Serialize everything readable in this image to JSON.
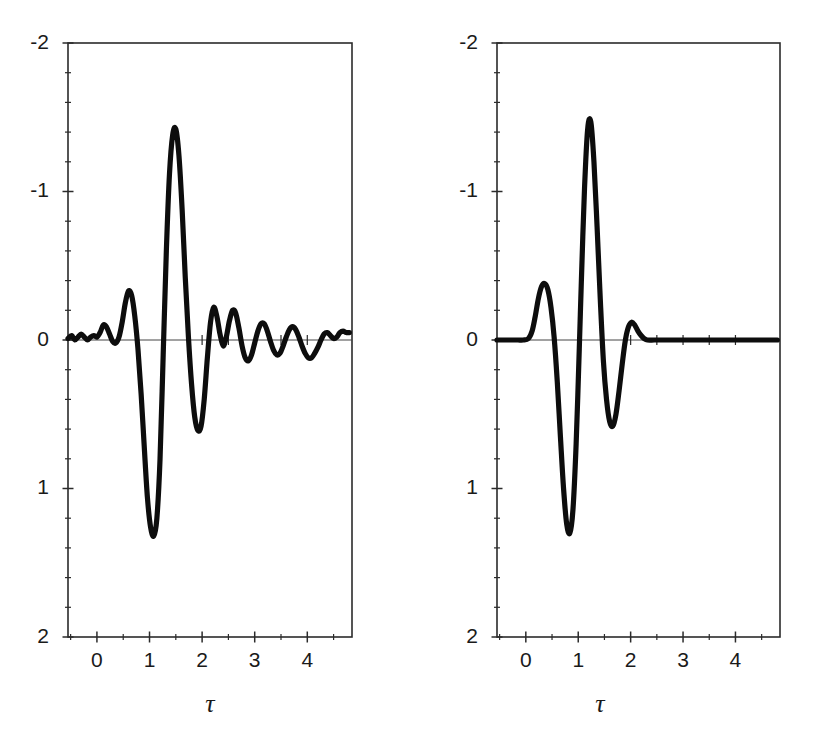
{
  "figure": {
    "background_color": "#ffffff",
    "ink_color": "#0d0d0d",
    "axis_color": "#2b2b2b",
    "panel_count": 2
  },
  "axis_title_symbol": "τ",
  "y_tick_labels": [
    "2",
    "1",
    "0",
    "-1",
    "-2"
  ],
  "x_tick_labels": [
    "0",
    "1",
    "2",
    "3",
    "4"
  ],
  "chart_data": [
    {
      "id": "left-panel",
      "type": "line",
      "title": "",
      "subtitle": "",
      "xlabel": "τ",
      "ylabel": "",
      "xlim": [
        -0.55,
        4.85
      ],
      "ylim": [
        -2,
        2
      ],
      "grid": false,
      "legend": "none",
      "x_major_ticks": [
        0,
        1,
        2,
        3,
        4
      ],
      "x_minor_tick_step": 0.5,
      "y_major_ticks": [
        -2,
        -1,
        0,
        1,
        2
      ],
      "y_minor_tick_step": 0.2,
      "series": [
        {
          "name": "wavelet-ringing",
          "description": "decaying oscillatory wavelet with long ringing tail",
          "peak_value": 1.42,
          "peak_x": 1.2,
          "trough_value": -1.32,
          "trough_x": 0.82,
          "x": [
            -0.55,
            -0.48,
            -0.42,
            -0.36,
            -0.3,
            -0.24,
            -0.18,
            -0.12,
            -0.06,
            0.0,
            0.06,
            0.12,
            0.18,
            0.24,
            0.3,
            0.36,
            0.42,
            0.48,
            0.54,
            0.6,
            0.66,
            0.72,
            0.78,
            0.84,
            0.9,
            0.96,
            1.02,
            1.08,
            1.14,
            1.2,
            1.26,
            1.32,
            1.38,
            1.44,
            1.5,
            1.56,
            1.62,
            1.68,
            1.74,
            1.8,
            1.86,
            1.92,
            1.98,
            2.04,
            2.1,
            2.16,
            2.22,
            2.28,
            2.34,
            2.4,
            2.46,
            2.52,
            2.58,
            2.64,
            2.7,
            2.76,
            2.82,
            2.88,
            2.94,
            3.0,
            3.06,
            3.12,
            3.18,
            3.24,
            3.3,
            3.36,
            3.42,
            3.48,
            3.54,
            3.6,
            3.66,
            3.72,
            3.78,
            3.84,
            3.9,
            3.96,
            4.02,
            4.08,
            4.14,
            4.2,
            4.26,
            4.32,
            4.38,
            4.44,
            4.5,
            4.56,
            4.62,
            4.68,
            4.74,
            4.8
          ],
          "y": [
            0.01,
            0.03,
            0.0,
            0.02,
            0.04,
            0.02,
            0.0,
            0.02,
            0.03,
            0.02,
            0.05,
            0.1,
            0.09,
            0.04,
            -0.01,
            -0.02,
            0.02,
            0.12,
            0.25,
            0.33,
            0.3,
            0.16,
            -0.06,
            -0.36,
            -0.72,
            -1.06,
            -1.26,
            -1.32,
            -1.2,
            -0.8,
            -0.1,
            0.6,
            1.12,
            1.38,
            1.42,
            1.24,
            0.88,
            0.42,
            0.02,
            -0.3,
            -0.52,
            -0.61,
            -0.58,
            -0.4,
            -0.12,
            0.12,
            0.22,
            0.16,
            0.04,
            -0.04,
            0.02,
            0.13,
            0.2,
            0.18,
            0.08,
            -0.04,
            -0.12,
            -0.14,
            -0.1,
            -0.02,
            0.06,
            0.11,
            0.11,
            0.06,
            -0.01,
            -0.07,
            -0.1,
            -0.09,
            -0.04,
            0.02,
            0.07,
            0.09,
            0.07,
            0.02,
            -0.04,
            -0.09,
            -0.12,
            -0.12,
            -0.09,
            -0.05,
            0.0,
            0.04,
            0.05,
            0.03,
            0.01,
            0.02,
            0.05,
            0.06,
            0.05,
            0.05
          ]
        }
      ]
    },
    {
      "id": "right-panel",
      "type": "line",
      "title": "",
      "subtitle": "",
      "xlabel": "τ",
      "ylabel": "",
      "xlim": [
        -0.55,
        4.85
      ],
      "ylim": [
        -2,
        2
      ],
      "grid": false,
      "legend": "none",
      "x_major_ticks": [
        0,
        1,
        2,
        3,
        4
      ],
      "x_minor_tick_step": 0.5,
      "y_major_ticks": [
        -2,
        -1,
        0,
        1,
        2
      ],
      "y_minor_tick_step": 0.2,
      "series": [
        {
          "name": "wavelet-compact",
          "description": "compactly supported wavelet, flat zero outside roughly 0.15 to 2.3",
          "peak_value": 1.47,
          "peak_x": 1.18,
          "trough_value": -1.3,
          "trough_x": 0.8,
          "x": [
            -0.55,
            -0.45,
            -0.35,
            -0.25,
            -0.15,
            -0.05,
            0.05,
            0.12,
            0.18,
            0.24,
            0.3,
            0.36,
            0.42,
            0.48,
            0.54,
            0.6,
            0.66,
            0.72,
            0.78,
            0.84,
            0.9,
            0.96,
            1.02,
            1.06,
            1.12,
            1.18,
            1.24,
            1.3,
            1.36,
            1.42,
            1.48,
            1.54,
            1.6,
            1.66,
            1.72,
            1.78,
            1.84,
            1.9,
            1.96,
            2.02,
            2.08,
            2.14,
            2.2,
            2.26,
            2.32,
            2.45,
            2.6,
            2.8,
            3.0,
            3.2,
            3.4,
            3.6,
            3.8,
            4.0,
            4.2,
            4.4,
            4.6,
            4.8
          ],
          "y": [
            0.0,
            0.0,
            0.0,
            0.0,
            0.0,
            0.0,
            0.01,
            0.06,
            0.16,
            0.28,
            0.36,
            0.38,
            0.34,
            0.22,
            0.02,
            -0.28,
            -0.65,
            -1.0,
            -1.24,
            -1.3,
            -1.14,
            -0.7,
            -0.06,
            0.4,
            1.02,
            1.42,
            1.47,
            1.2,
            0.76,
            0.28,
            -0.14,
            -0.4,
            -0.55,
            -0.58,
            -0.5,
            -0.34,
            -0.16,
            0.0,
            0.09,
            0.12,
            0.1,
            0.06,
            0.03,
            0.01,
            0.0,
            0.0,
            0.0,
            0.0,
            0.0,
            0.0,
            0.0,
            0.0,
            0.0,
            0.0,
            0.0,
            0.0,
            0.0,
            0.0
          ]
        }
      ]
    }
  ]
}
